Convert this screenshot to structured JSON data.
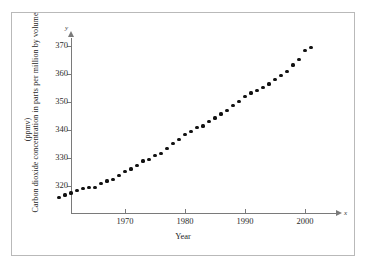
{
  "figure": {
    "border_color": "#b9b9b9",
    "background": "#ffffff"
  },
  "axes": {
    "y_variable_label": "y",
    "x_variable_label": "x",
    "axis_color": "#7a7a7a"
  },
  "chart_data": {
    "type": "scatter",
    "title": "",
    "xlabel": "Year",
    "ylabel": "Carbon dioxide concentration in parts per million by volume",
    "ylabel_sub": "(ppmv)",
    "xlim": [
      1958,
      2003
    ],
    "ylim": [
      313,
      372
    ],
    "grid": false,
    "legend": null,
    "xticks": [
      1970,
      1980,
      1990,
      2000
    ],
    "xtick_labels": [
      "1970",
      "1980",
      "1990",
      "2000"
    ],
    "yticks": [
      320,
      330,
      340,
      350,
      360,
      370
    ],
    "ytick_labels": [
      "320",
      "330",
      "340",
      "350",
      "360",
      "370"
    ],
    "marker": "filled-circle",
    "marker_color": "#111111",
    "x": [
      1959,
      1960,
      1961,
      1962,
      1963,
      1964,
      1965,
      1966,
      1967,
      1968,
      1969,
      1970,
      1971,
      1972,
      1973,
      1974,
      1975,
      1976,
      1977,
      1978,
      1979,
      1980,
      1981,
      1982,
      1983,
      1984,
      1985,
      1986,
      1987,
      1988,
      1989,
      1990,
      1991,
      1992,
      1993,
      1994,
      1995,
      1996,
      1997,
      1998,
      1999,
      2000,
      2001
    ],
    "y": [
      315.8,
      316.8,
      317.5,
      318.3,
      319.0,
      319.5,
      319.6,
      320.8,
      321.8,
      322.4,
      323.8,
      325.3,
      326.1,
      327.2,
      328.9,
      329.5,
      330.9,
      331.6,
      333.5,
      335.2,
      336.5,
      338.4,
      339.6,
      340.8,
      341.4,
      343.0,
      344.3,
      345.7,
      347.0,
      348.7,
      350.3,
      352.1,
      353.2,
      354.0,
      355.3,
      356.4,
      357.9,
      359.6,
      361.0,
      363.2,
      365.3,
      368.3,
      369.4,
      370.5
    ]
  }
}
